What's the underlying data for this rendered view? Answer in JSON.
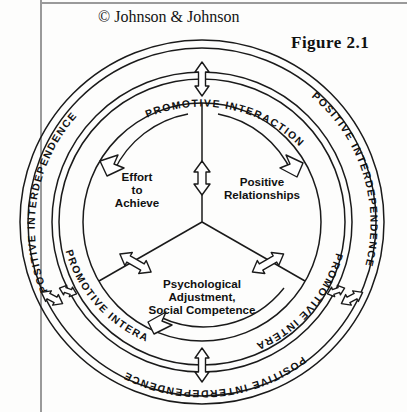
{
  "page": {
    "credit": "© Johnson & Johnson",
    "figure_label": "Figure 2.1",
    "background_color": "#fdfdfc",
    "ink_color": "#1a1a1a"
  },
  "diagram": {
    "type": "concentric-ring-cycle",
    "center": {
      "x": 202,
      "y": 222
    },
    "rings": [
      {
        "name": "outer-ring",
        "label_text": "POSITIVE INTERDEPENDENCE",
        "segments": [
          {
            "position": "upper-left",
            "text": "POSITIVE INTERDEPENDENCE"
          },
          {
            "position": "upper-right",
            "text": "POSITIVE INTERDEPENDENCE"
          },
          {
            "position": "bottom",
            "text": "POSITIVE INTERDEPENDENCE"
          }
        ]
      },
      {
        "name": "inner-ring",
        "label_text": "PROMOTIVE INTERACTION",
        "segments": [
          {
            "position": "top",
            "text": "PROMOTIVE INTERACTION"
          },
          {
            "position": "lower-left",
            "text": "PROMOTIVE INTERACTION"
          },
          {
            "position": "lower-right",
            "text": "PROMOTIVE INTERACTION"
          }
        ]
      }
    ],
    "sectors": [
      {
        "name": "effort-to-achieve",
        "lines": [
          "Effort",
          "to",
          "Achieve"
        ]
      },
      {
        "name": "positive-relationships",
        "lines": [
          "Positive",
          "Relationships"
        ]
      },
      {
        "name": "psychological-adjustment",
        "lines": [
          "Psychological",
          "Adjustment,",
          "Social Competence"
        ]
      }
    ],
    "connectors": {
      "count": 3,
      "style": "double-headed-arrow",
      "description": "bidirectional arrows on each spoke between sectors"
    },
    "ring_crossing_arrows": {
      "count": 6,
      "style": "double-headed-arrow"
    },
    "circulation_arrows": {
      "count": 3,
      "style": "curved-arrowhead",
      "direction": "clockwise"
    }
  }
}
